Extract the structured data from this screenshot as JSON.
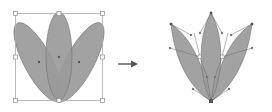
{
  "diagram": {
    "colors": {
      "petal_fill": "#9a9a9a",
      "petal_stroke": "#6e6e6e",
      "bbox_stroke": "#a8a8a8",
      "handle_fill": "#ffffff",
      "anchor_fill": "#555555",
      "arrow": "#555555",
      "background": "#ffffff"
    },
    "left_shape": {
      "label": "before",
      "bbox": {
        "x": 15,
        "y": 13,
        "w": 87,
        "h": 87
      }
    },
    "arrow": {
      "x1": 118,
      "y1": 64,
      "x2": 137,
      "y2": 64,
      "icon": "right-arrow-icon"
    },
    "right_shape": {
      "label": "after"
    }
  }
}
